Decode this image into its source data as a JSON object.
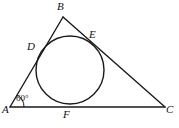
{
  "figure": {
    "stroke_color": "#1a1a1a",
    "background_color": "#ffffff",
    "circle_color": "#1a1a1a",
    "labels": {
      "A": "A",
      "B": "B",
      "C": "C",
      "D": "D",
      "E": "E",
      "F": "F",
      "angle_A": "60°"
    },
    "geometry": {
      "triangle": {
        "A": [
          10,
          107
        ],
        "B": [
          63,
          17
        ],
        "C": [
          165,
          107
        ]
      },
      "incircle": {
        "center": [
          70,
          70
        ],
        "radius": 34
      },
      "tangent_points": {
        "D": [
          41,
          48
        ],
        "E": [
          98,
          44
        ],
        "F": [
          70,
          105
        ]
      },
      "angle_arc": {
        "vertex": "A",
        "radius": 14,
        "value": "60°"
      }
    }
  }
}
